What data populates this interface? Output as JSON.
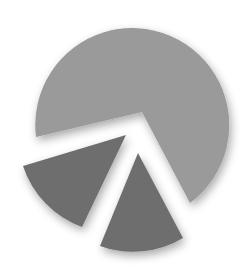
{
  "chart_data": {
    "type": "pie",
    "title": "",
    "exploded": true,
    "legend": "none",
    "slices": [
      {
        "name": "slice-large",
        "percent": 72,
        "color": "#9a9a9a",
        "path": "M142,112 L36,137 A97,97 0 1 1 190,203 Z"
      },
      {
        "name": "slice-left",
        "percent": 14,
        "color": "#6e6e6e",
        "path": "M126,135 L23,166 A97,97 0 0 0 82,227 Z"
      },
      {
        "name": "slice-bottom",
        "percent": 14,
        "color": "#6e6e6e",
        "path": "M138,153 L100,246 A97,97 0 0 0 183,238 Z"
      }
    ]
  }
}
